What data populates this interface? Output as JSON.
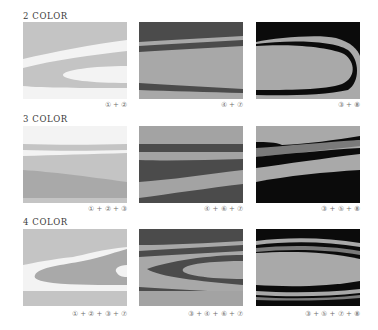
{
  "rows": [
    {
      "title": "2 COLOR",
      "panels": [
        {
          "caption": "① + ②"
        },
        {
          "caption": "④ + ⑦"
        },
        {
          "caption": "③ + ⑧"
        }
      ]
    },
    {
      "title": "3 COLOR",
      "panels": [
        {
          "caption": "① + ② + ③"
        },
        {
          "caption": "④ + ⑥ + ⑦"
        },
        {
          "caption": "③ + ⑤ + ⑧"
        }
      ]
    },
    {
      "title": "4 COLOR",
      "panels": [
        {
          "caption": "① + ② + ③ + ⑦"
        },
        {
          "caption": "③ + ④ + ⑥ + ⑦"
        },
        {
          "caption": "③ + ⑤ + ⑦ + ⑧"
        }
      ]
    }
  ],
  "palette": {
    "c1": "#f3f3f3",
    "c2": "#c4c4c4",
    "c3": "#a9a9a9",
    "c4": "#a3a3a3",
    "c5": "#7a7a7a",
    "c6": "#4b4b4b",
    "c7": "#a8a8a8",
    "c8": "#0b0b0b"
  }
}
